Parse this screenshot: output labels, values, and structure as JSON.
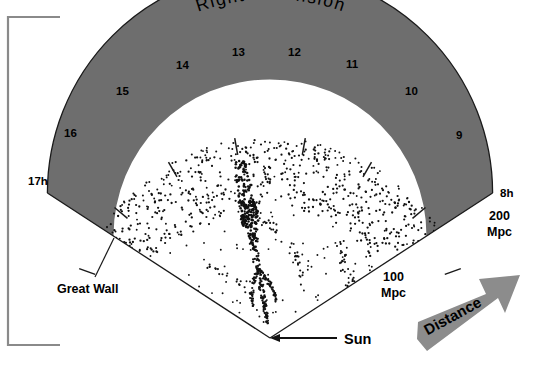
{
  "figure": {
    "title": "Right ascension",
    "frame_color": "#7d7d7d",
    "background": "#ffffff"
  },
  "chart_data": {
    "type": "scatter",
    "title": "Right ascension",
    "xlabel": "Right ascension",
    "ylabel": "Distance",
    "radial_axis": {
      "label": "Distance",
      "unit": "Mpc",
      "ticks": [
        {
          "value": 100,
          "label_line1": "100",
          "label_line2": "Mpc"
        },
        {
          "value": 200,
          "label_line1": "200",
          "label_line2": "Mpc"
        }
      ],
      "origin_label": "Sun",
      "range": [
        0,
        200
      ]
    },
    "angular_axis": {
      "label": "Right ascension",
      "unit": "h",
      "min": 8,
      "max": 17,
      "tick_labels": [
        "8h",
        "9",
        "10",
        "11",
        "12",
        "13",
        "14",
        "15",
        "16",
        "17h"
      ],
      "tick_values": [
        8,
        9,
        10,
        11,
        12,
        13,
        14,
        15,
        16,
        17
      ]
    },
    "annotations": [
      {
        "name": "great-wall",
        "text": "Great Wall",
        "points_to": "shaded band at left edge"
      },
      {
        "name": "sun",
        "text": "Sun",
        "points_to": "wedge apex"
      },
      {
        "name": "distance",
        "text": "Distance",
        "points_to": "outward radial direction"
      }
    ],
    "highlight_band": {
      "name": "Great Wall",
      "inner_distance_mpc": 128,
      "outer_distance_mpc": 200,
      "fill": "#6e6e6e"
    },
    "grid": false,
    "legend": false,
    "point_color": "#111111",
    "point_count_approx": 1100,
    "features": [
      {
        "name": "finger-of-god",
        "label": "Coma cluster finger",
        "ra_h": 13.0,
        "distance_mpc": 130
      },
      {
        "name": "stick-man",
        "label": "Stick Man filament",
        "ra_h": 13.0,
        "distance_mpc": 60
      }
    ]
  },
  "labels": {
    "title": "Right ascension",
    "ra_17h": "17h",
    "ra_16": "16",
    "ra_15": "15",
    "ra_14": "14",
    "ra_13": "13",
    "ra_12": "12",
    "ra_11": "11",
    "ra_10": "10",
    "ra_9": "9",
    "ra_8h": "8h",
    "mpc200_line1": "200",
    "mpc200_line2": "Mpc",
    "mpc100_line1": "100",
    "mpc100_line2": "Mpc",
    "great_wall": "Great Wall",
    "sun": "Sun",
    "distance": "Distance"
  },
  "colors": {
    "band_gray": "#6e6e6e",
    "arrow_gray": "#8c8c8c",
    "line_black": "#111111",
    "frame_gray": "#7d7d7d"
  }
}
